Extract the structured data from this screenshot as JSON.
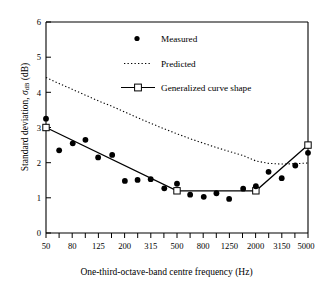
{
  "chart_data": {
    "type": "scatter",
    "title": "",
    "xlabel": "One-third-octave-band centre frequency (Hz)",
    "ylabel": "Standard deviation, σdB (dB)",
    "ylabel_main": "Standard deviation,",
    "ylabel_symbol": "σ",
    "ylabel_subscript": "dB",
    "ylabel_units": "(dB)",
    "xscale": "log",
    "xlim": [
      50,
      5000
    ],
    "ylim": [
      0,
      6
    ],
    "yticks": [
      0,
      1,
      2,
      3,
      4,
      5,
      6
    ],
    "ytick_labels": [
      "0",
      "1",
      "2",
      "3",
      "4",
      "5",
      "6"
    ],
    "xticks": [
      50,
      63,
      80,
      100,
      125,
      160,
      200,
      250,
      315,
      400,
      500,
      630,
      800,
      1000,
      1250,
      1600,
      2000,
      2500,
      3150,
      4000,
      5000
    ],
    "xtick_labels": [
      "50",
      "",
      "80",
      "",
      "125",
      "",
      "200",
      "",
      "315",
      "",
      "500",
      "",
      "800",
      "",
      "1250",
      "",
      "2000",
      "",
      "3150",
      "",
      "5000"
    ],
    "xtick_labels_shown": [
      "50",
      "80",
      "125",
      "200",
      "315",
      "500",
      "800",
      "1250",
      "2000",
      "3150",
      "5000"
    ],
    "grid": false,
    "legend_position": "upper-center",
    "series": [
      {
        "name": "Measured",
        "type": "scatter",
        "marker": "filled-circle",
        "color": "#000000",
        "x": [
          50,
          63,
          80,
          100,
          125,
          160,
          200,
          250,
          315,
          400,
          500,
          630,
          800,
          1000,
          1250,
          1600,
          2000,
          2500,
          3150,
          4000,
          5000
        ],
        "y": [
          3.25,
          2.35,
          2.55,
          2.65,
          2.15,
          2.22,
          1.48,
          1.51,
          1.53,
          1.27,
          1.4,
          1.09,
          1.03,
          1.13,
          0.97,
          1.26,
          1.33,
          1.74,
          1.56,
          1.92,
          2.28
        ]
      },
      {
        "name": "Predicted",
        "type": "line",
        "linestyle": "dotted",
        "color": "#000000",
        "x": [
          50,
          63,
          80,
          100,
          125,
          160,
          200,
          250,
          315,
          400,
          500,
          630,
          800,
          1000,
          1250,
          1600,
          2000,
          2500,
          3150,
          4000,
          5000
        ],
        "y": [
          4.42,
          4.25,
          4.08,
          3.92,
          3.76,
          3.6,
          3.44,
          3.28,
          3.12,
          2.96,
          2.82,
          2.68,
          2.55,
          2.43,
          2.32,
          2.2,
          2.05,
          1.98,
          1.96,
          1.97,
          1.99
        ]
      },
      {
        "name": "Generalized curve shape",
        "type": "line",
        "linestyle": "solid",
        "marker": "open-square",
        "color": "#000000",
        "x": [
          50,
          500,
          2000,
          5000
        ],
        "y": [
          3.0,
          1.2,
          1.2,
          2.5
        ]
      }
    ],
    "legend": [
      {
        "label": "Measured",
        "symbol": "filled-circle"
      },
      {
        "label": "Predicted",
        "symbol": "dotted-line"
      },
      {
        "label": "Generalized curve shape",
        "symbol": "line-with-open-square"
      }
    ]
  }
}
